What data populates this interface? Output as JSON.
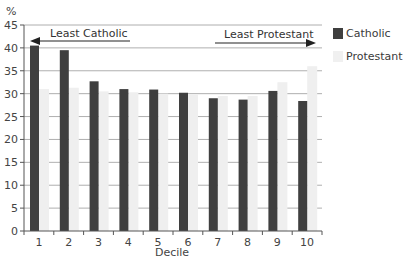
{
  "chart_data": {
    "type": "bar",
    "title": "",
    "xlabel": "Decile",
    "ylabel": "%",
    "ylim": [
      0,
      45
    ],
    "yticks": [
      0,
      5,
      10,
      15,
      20,
      25,
      30,
      35,
      40,
      45
    ],
    "categories": [
      "1",
      "2",
      "3",
      "4",
      "5",
      "6",
      "7",
      "8",
      "9",
      "10"
    ],
    "series": [
      {
        "name": "Catholic",
        "color": "#3f3f3f",
        "values": [
          40.5,
          39.5,
          32.7,
          31.0,
          30.9,
          30.2,
          29.0,
          28.7,
          30.6,
          28.4
        ]
      },
      {
        "name": "Protestant",
        "color": "#efefef",
        "values": [
          31.0,
          31.3,
          30.5,
          30.3,
          30.0,
          29.8,
          29.5,
          29.5,
          32.5,
          36.0
        ]
      }
    ],
    "grid": true,
    "legend_position": "right",
    "annotations": [
      {
        "text": "Least Catholic",
        "arrow": "left"
      },
      {
        "text": "Least Protestant",
        "arrow": "right"
      }
    ]
  },
  "legend": {
    "catholic": "Catholic",
    "protestant": "Protestant"
  },
  "labels": {
    "y_unit": "%",
    "x_axis": "Decile",
    "least_catholic": "Least Catholic",
    "least_protestant": "Least Protestant"
  }
}
